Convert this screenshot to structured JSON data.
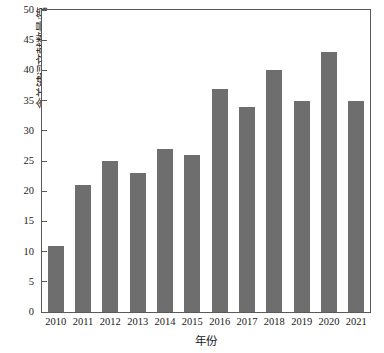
{
  "chart_data": {
    "type": "bar",
    "title": "",
    "subtitle": "",
    "xlabel": "年份",
    "ylabel": "含关键词文献数量/篇",
    "categories": [
      "2010",
      "2011",
      "2012",
      "2013",
      "2014",
      "2015",
      "2016",
      "2017",
      "2018",
      "2019",
      "2020",
      "2021"
    ],
    "values": [
      11,
      21,
      25,
      23,
      27,
      26,
      37,
      34,
      40,
      35,
      43,
      35
    ],
    "series": [
      {
        "name": "含关键词文献数量",
        "values": [
          11,
          21,
          25,
          23,
          27,
          26,
          37,
          34,
          40,
          35,
          43,
          35
        ]
      }
    ],
    "ylim": [
      0,
      50
    ],
    "ytick_values": [
      0,
      5,
      10,
      15,
      20,
      25,
      30,
      35,
      40,
      45,
      50
    ],
    "ytick_labels": [
      "0",
      "5",
      "10",
      "15",
      "20",
      "25",
      "30",
      "35",
      "40",
      "45",
      "50"
    ],
    "xtick_labels": [
      "2010",
      "2011",
      "2012",
      "2013",
      "2014",
      "2015",
      "2016",
      "2017",
      "2018",
      "2019",
      "2020",
      "2021"
    ],
    "grid": false,
    "legend": null,
    "legend_position": "none",
    "bar_color": "#6e6e6e",
    "axis_color": "#5a5a5a",
    "background_color": "#ffffff",
    "annotations": []
  }
}
